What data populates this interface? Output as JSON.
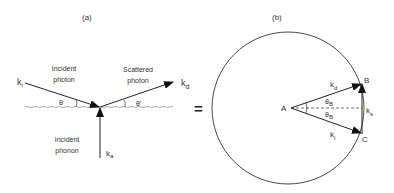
{
  "panel_a": {
    "label": "(a)",
    "incident_photon": [
      "Incident",
      "photon"
    ],
    "scattered_photon": [
      "Scattered",
      "photon"
    ],
    "incident_phonon": [
      "Incident",
      "phonon"
    ],
    "k_incident": {
      "base": "k",
      "sub": "i"
    },
    "k_scattered": {
      "base": "k",
      "sub": "d"
    },
    "k_phonon": {
      "base": "k",
      "sub": "a"
    },
    "angle_in": "θ",
    "angle_out": "θ′"
  },
  "equals": "=",
  "panel_b": {
    "label": "(b)",
    "point_a": "A",
    "point_b": "B",
    "point_c": "C",
    "k_d": {
      "base": "k",
      "sub": "d"
    },
    "k_i": {
      "base": "k",
      "sub": "i"
    },
    "k_s": {
      "base": "k",
      "sub": "s"
    },
    "theta_upper": {
      "base": "θ",
      "sub": "B"
    },
    "theta_lower": {
      "base": "θ",
      "sub": "B"
    }
  },
  "colors": {
    "line": "#222222",
    "text": "#333333"
  }
}
